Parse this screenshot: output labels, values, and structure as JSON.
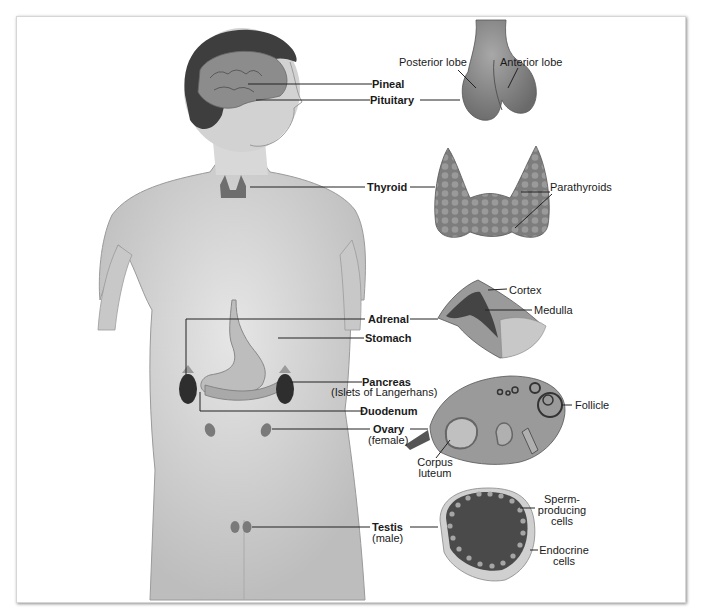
{
  "figure": {
    "glands": [
      {
        "id": "pineal",
        "label": "Pineal"
      },
      {
        "id": "pituitary",
        "label": "Pituitary"
      },
      {
        "id": "thyroid",
        "label": "Thyroid"
      },
      {
        "id": "adrenal",
        "label": "Adrenal"
      },
      {
        "id": "stomach",
        "label": "Stomach"
      },
      {
        "id": "pancreas",
        "label": "Pancreas",
        "sublabel": "(Islets of Langerhans)"
      },
      {
        "id": "duodenum",
        "label": "Duodenum"
      },
      {
        "id": "ovary",
        "label": "Ovary",
        "sublabel": "(female)"
      },
      {
        "id": "testis",
        "label": "Testis",
        "sublabel": "(male)"
      }
    ],
    "details": {
      "pituitary": {
        "posterior": "Posterior lobe",
        "anterior": "Anterior lobe"
      },
      "thyroid": {
        "parathyroids": "Parathyroids"
      },
      "adrenal": {
        "cortex": "Cortex",
        "medulla": "Medulla"
      },
      "ovary": {
        "follicle": "Follicle",
        "corpus_line1": "Corpus",
        "corpus_line2": "luteum"
      },
      "testis": {
        "sperm_line1": "Sperm-",
        "sperm_line2": "producing",
        "sperm_line3": "cells",
        "endo_line1": "Endocrine",
        "endo_line2": "cells"
      }
    },
    "colors": {
      "skin": "#d4d4d4",
      "gland": "#8a8a8a",
      "dark": "#3a3a3a",
      "line": "#222222"
    }
  }
}
